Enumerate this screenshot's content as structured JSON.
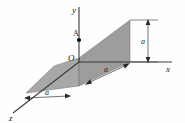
{
  "figure": {
    "name": "3d-quarter-plate-figure",
    "background_color": "#fefefe",
    "line_color": "#1a1a1a",
    "axes": {
      "y": {
        "label": "y"
      },
      "x": {
        "label": "x"
      },
      "z": {
        "label": "z"
      }
    },
    "origin": {
      "label": "O"
    },
    "point": {
      "label": "A"
    },
    "dimensions": {
      "vertical": {
        "label": "a"
      },
      "x_direction": {
        "label": "a"
      },
      "z_direction": {
        "label": "a"
      }
    },
    "surfaces": {
      "vertical_plate_color": "#9d9d9d",
      "horizontal_plate_color": "#a8a8a8"
    }
  }
}
